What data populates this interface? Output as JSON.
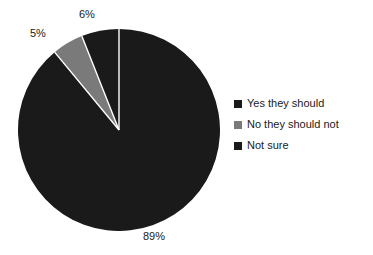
{
  "chart_data": {
    "type": "pie",
    "title": "",
    "subtitle": "",
    "xlabel": "",
    "ylabel": "",
    "legend_position": "right",
    "grid": false,
    "start_angle_deg": 0,
    "direction": "clockwise",
    "categories": [
      "Yes they should",
      "No they should not",
      "Not sure"
    ],
    "values": [
      89,
      5,
      6
    ],
    "value_unit": "%",
    "data_labels": [
      "89%",
      "5%",
      "6%"
    ],
    "colors": [
      "#1a1a1a",
      "#7a7a7a",
      "#1a1a1a"
    ],
    "slices": [
      {
        "label": "Yes they should",
        "value": 89,
        "data_label": "89%",
        "color": "#1a1a1a",
        "start_deg": 0,
        "end_deg": 320.4
      },
      {
        "label": "No they should not",
        "value": 5,
        "data_label": "5%",
        "color": "#7a7a7a",
        "start_deg": 320.4,
        "end_deg": 338.4
      },
      {
        "label": "Not sure",
        "value": 6,
        "data_label": "6%",
        "color": "#1a1a1a",
        "start_deg": 338.4,
        "end_deg": 360
      }
    ],
    "legend": [
      {
        "label": "Yes they should",
        "color": "#1a1a1a"
      },
      {
        "label": "No they should not",
        "color": "#7a7a7a"
      },
      {
        "label": "Not sure",
        "color": "#1a1a1a"
      }
    ],
    "separator_color": "#ffffff",
    "background_color": "#ffffff"
  }
}
